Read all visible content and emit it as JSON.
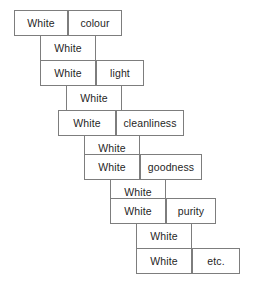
{
  "diagram": {
    "type": "cascade-collocation-chain",
    "node_label": "White",
    "terminal_label": "etc.",
    "colors": {
      "border": "#7d7d7d",
      "background": "#ffffff",
      "text": "#1f1f1f"
    },
    "steps": [
      {
        "left": "White",
        "right": "colour"
      },
      {
        "left": "White",
        "right": "light"
      },
      {
        "left": "White",
        "right": "cleanliness"
      },
      {
        "left": "White",
        "right": "goodness"
      },
      {
        "left": "White",
        "right": "purity"
      },
      {
        "left": "White",
        "right": "etc."
      }
    ],
    "connectors": [
      {
        "label": "White"
      },
      {
        "label": "White"
      },
      {
        "label": "White"
      },
      {
        "label": "White"
      },
      {
        "label": "White"
      }
    ],
    "geometry": {
      "step_x": [
        14,
        40,
        66,
        92,
        110,
        136
      ],
      "step_y": [
        10,
        60,
        110,
        152,
        196,
        246
      ],
      "left_width": 54,
      "right_width": [
        54,
        48,
        66,
        62,
        56,
        56
      ],
      "connector_x": [
        40,
        66,
        92,
        110,
        136
      ],
      "connector_y": [
        35,
        85,
        127,
        171,
        221
      ],
      "connector_width": 56,
      "row_height": 26
    }
  }
}
